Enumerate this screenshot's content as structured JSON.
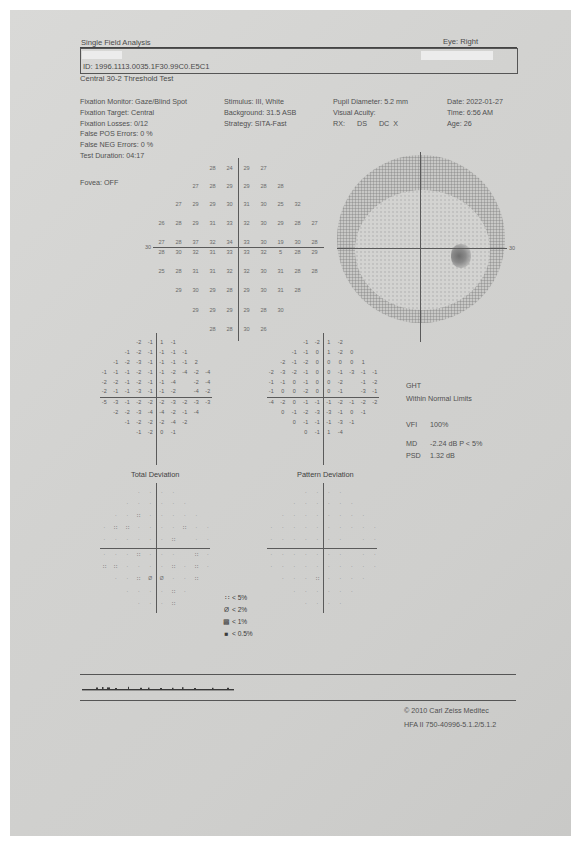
{
  "header": {
    "title": "Single Field Analysis",
    "eye": "Eye: Right",
    "patient_id": "ID: 1996.1113.0035.1F30.99C0.E5C1",
    "test_name": "Central 30-2 Threshold Test"
  },
  "parameters": {
    "col1": [
      "Fixation Monitor: Gaze/Blind Spot",
      "Fixation Target: Central",
      "Fixation Losses: 0/12",
      "False POS Errors:  0 %",
      "False NEG Errors:  0 %",
      "Test Duration: 04:17"
    ],
    "col2": [
      "Stimulus: III, White",
      "Background: 31.5 ASB",
      "Strategy: SITA-Fast"
    ],
    "col3": [
      "Pupil Diameter: 5.2 mm",
      "Visual Acuity:",
      "RX:      DS      DC  X"
    ],
    "col4": [
      "Date: 2022-01-27",
      "Time: 6:56 AM",
      "Age: 26"
    ],
    "fovea": "Fovea: OFF"
  },
  "sensitivity_plot": {
    "axis_label_left": "30",
    "axis_label_right": "30",
    "rows": [
      [
        "28",
        "24",
        "29",
        "27"
      ],
      [
        "27",
        "28",
        "29",
        "29",
        "28",
        "28"
      ],
      [
        "27",
        "29",
        "29",
        "30",
        "31",
        "30",
        "25",
        "32"
      ],
      [
        "26",
        "28",
        "29",
        "31",
        "33",
        "32",
        "30",
        "29",
        "28",
        "27"
      ],
      [
        "27",
        "28",
        "37",
        "32",
        "34",
        "33",
        "30",
        "19",
        "30",
        "28"
      ],
      [
        "28",
        "30",
        "32",
        "31",
        "33",
        "33",
        "32",
        "5",
        "28",
        "29"
      ],
      [
        "25",
        "28",
        "31",
        "31",
        "32",
        "32",
        "30",
        "31",
        "28",
        "28"
      ],
      [
        "29",
        "30",
        "29",
        "28",
        "29",
        "30",
        "31",
        "28"
      ],
      [
        "29",
        "29",
        "29",
        "29",
        "28",
        "30"
      ],
      [
        "28",
        "28",
        "30",
        "26"
      ]
    ]
  },
  "total_deviation": {
    "label": "Total Deviation",
    "rows": [
      [
        "-2",
        "-1",
        "1",
        "-1"
      ],
      [
        "-1",
        "-2",
        "-1",
        "-1",
        "-1",
        "-1"
      ],
      [
        "-1",
        "-2",
        "-3",
        "-1",
        "-1",
        "-1",
        "-1",
        "2"
      ],
      [
        "-1",
        "-1",
        "-1",
        "-2",
        "-1",
        "-1",
        "-2",
        "-4",
        "-2",
        "-4"
      ],
      [
        "-2",
        "-2",
        "-1",
        "-2",
        "-1",
        "-1",
        "-4",
        "",
        "-2",
        "-4"
      ],
      [
        "-2",
        "-1",
        "-1",
        "-3",
        "-1",
        "-1",
        "-2",
        "",
        "-4",
        "-2"
      ],
      [
        "-5",
        "-3",
        "-1",
        "-2",
        "-2",
        "-2",
        "-3",
        "-2",
        "-3",
        "-3"
      ],
      [
        "-2",
        "-2",
        "-3",
        "-4",
        "-4",
        "-2",
        "-1",
        "-4"
      ],
      [
        "-1",
        "-2",
        "-2",
        "-2",
        "-4",
        "-2"
      ],
      [
        "-1",
        "-2",
        "0",
        "-1"
      ]
    ],
    "prob_rows": [
      [
        "·",
        "·",
        "·",
        "·"
      ],
      [
        "·",
        "·",
        "·",
        "·",
        "·",
        "·"
      ],
      [
        "·",
        "·",
        "∷",
        "·",
        "·",
        "·",
        "·",
        "·"
      ],
      [
        "·",
        "∷",
        "∷",
        "·",
        "·",
        "·",
        "·",
        "∷",
        "·",
        "·"
      ],
      [
        "·",
        "·",
        "·",
        "·",
        "·",
        "·",
        "∷",
        "",
        "·",
        "·"
      ],
      [
        "·",
        "·",
        "·",
        "∷",
        "·",
        "·",
        "·",
        "",
        "∷",
        "·"
      ],
      [
        "∷",
        "∷",
        "·",
        "·",
        "·",
        "·",
        "∷",
        "·",
        "∷",
        "·"
      ],
      [
        "·",
        "·",
        "∷",
        "Ø",
        "Ø",
        "·",
        "·",
        "∷"
      ],
      [
        "·",
        "·",
        "·",
        "·",
        "∷",
        "·"
      ],
      [
        "·",
        "·",
        "·",
        "∷"
      ]
    ]
  },
  "pattern_deviation": {
    "label": "Pattern Deviation",
    "rows": [
      [
        "-1",
        "-2",
        "1",
        "-2"
      ],
      [
        "-1",
        "-1",
        "0",
        "1",
        "-2",
        "0"
      ],
      [
        "-2",
        "-1",
        "-2",
        "0",
        "0",
        "0",
        "0",
        "1"
      ],
      [
        "-2",
        "-3",
        "-2",
        "-1",
        "0",
        "0",
        "-1",
        "-3",
        "-1",
        "-1"
      ],
      [
        "-1",
        "-1",
        "0",
        "-1",
        "0",
        "0",
        "-2",
        "",
        "-1",
        "-2"
      ],
      [
        "-1",
        "0",
        "0",
        "-2",
        "0",
        "0",
        "-1",
        "",
        "-3",
        "-1"
      ],
      [
        "-4",
        "-2",
        "0",
        "-1",
        "-1",
        "-1",
        "-2",
        "-1",
        "-2",
        "-2"
      ],
      [
        "0",
        "-1",
        "-2",
        "-3",
        "-3",
        "-1",
        "0",
        "-1"
      ],
      [
        "0",
        "-1",
        "-1",
        "-1",
        "-3",
        "-1"
      ],
      [
        "0",
        "-1",
        "1",
        "-4"
      ]
    ],
    "prob_rows": [
      [
        "·",
        "·",
        "·",
        "·"
      ],
      [
        "·",
        "·",
        "·",
        "·",
        "·",
        "·"
      ],
      [
        "·",
        "·",
        "·",
        "·",
        "·",
        "·",
        "·",
        "·"
      ],
      [
        "·",
        "·",
        "·",
        "·",
        "·",
        "·",
        "·",
        "·",
        "·",
        "·"
      ],
      [
        "·",
        "·",
        "·",
        "·",
        "·",
        "·",
        "·",
        "",
        "·",
        "·"
      ],
      [
        "·",
        "·",
        "·",
        "·",
        "·",
        "·",
        "·",
        "",
        "·",
        "·"
      ],
      [
        "·",
        "·",
        "·",
        "·",
        "·",
        "·",
        "·",
        "·",
        "·",
        "·"
      ],
      [
        "·",
        "·",
        "·",
        "∷",
        "·",
        "·",
        "·",
        "·"
      ],
      [
        "·",
        "·",
        "·",
        "·",
        "·",
        "·"
      ],
      [
        "·",
        "·",
        "·",
        "·"
      ]
    ]
  },
  "indices": {
    "ght_label": "GHT",
    "ght_value": "Within Normal Limits",
    "vfi_label": "VFI",
    "vfi_value": "100%",
    "md_label": "MD",
    "md_value": "-2.24 dB  P < 5%",
    "psd_label": "PSD",
    "psd_value": "1.32 dB"
  },
  "legend": [
    {
      "icon": "∷",
      "label": "< 5%"
    },
    {
      "icon": "Ø",
      "label": "< 2%"
    },
    {
      "icon": "▩",
      "label": "< 1%"
    },
    {
      "icon": "■",
      "label": "< 0.5%"
    }
  ],
  "footer": {
    "copyright": "© 2010 Carl Zeiss Meditec",
    "version": "HFA II 750-40996-5.1.2/5.1.2"
  }
}
